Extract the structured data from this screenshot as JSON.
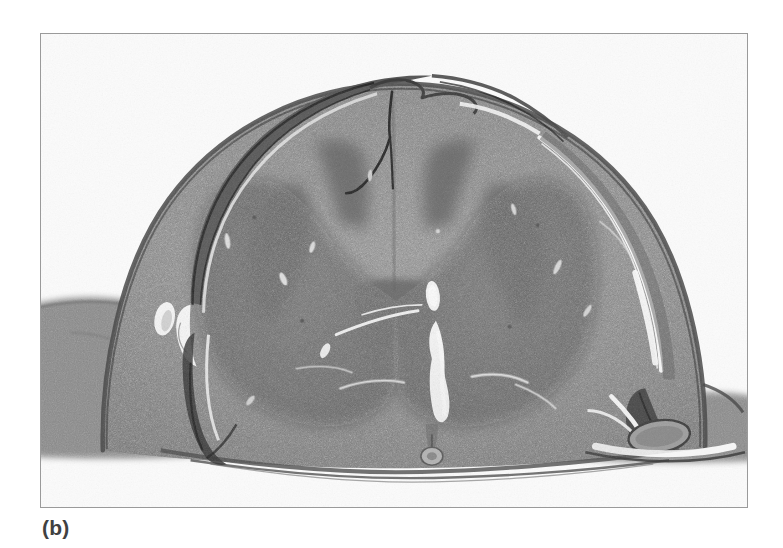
{
  "figure": {
    "caption": "(b)",
    "panel_label": "b",
    "type": "photomicrograph",
    "modality": "light microscopy, transverse histological section",
    "color_mode": "grayscale",
    "page_background": "#ffffff",
    "frame": {
      "border_color": "#9a9a9a",
      "border_width_px": 1,
      "x": 40,
      "y": 33,
      "width": 708,
      "height": 475
    },
    "slide_background": "#fbfbfb"
  },
  "specimen": {
    "name": "Spinal cord transverse section",
    "regions": [
      {
        "name": "white-matter",
        "label": "White matter (funiculi)",
        "tone": "#8d8d8d"
      },
      {
        "name": "gray-matter",
        "label": "Gray matter (butterfly / H-shaped)",
        "tone": "#6f6f6f"
      },
      {
        "name": "posterior-horn",
        "label": "Posterior (dorsal) horn",
        "tone": "#6a6a6a"
      },
      {
        "name": "anterior-horn",
        "label": "Anterior (ventral) horn",
        "tone": "#767676"
      },
      {
        "name": "central-canal",
        "label": "Central canal",
        "tone": "#f6f6f6"
      },
      {
        "name": "anterior-median-fissure",
        "label": "Anterior median fissure",
        "tone": "#f2f2f2"
      },
      {
        "name": "posterior-median-septum",
        "label": "Posterior median septum",
        "tone": "#3a3a3a"
      },
      {
        "name": "pia-mater",
        "label": "Pia mater",
        "tone": "#4a4a4a"
      },
      {
        "name": "dura-mater",
        "label": "Detached dura mater strip",
        "tone": "#5b5b5b"
      },
      {
        "name": "nerve-root",
        "label": "Nerve root / adjacent connective tissue",
        "tone": "#7a7a7a"
      },
      {
        "name": "blood-vessel",
        "label": "Blood vessel",
        "tone": "#c9c9c9"
      },
      {
        "name": "sectioning-artifact",
        "label": "Tear / sectioning artifact",
        "tone": "#fafafa"
      }
    ],
    "palette": {
      "background": "#fbfbfb",
      "white_matter": "#8d8d8d",
      "gray_matter": "#6f6f6f",
      "membrane_dark": "#3f3f3f",
      "artifact_light": "#f7f7f7",
      "frame": "#9a9a9a",
      "caption_text": "#414141"
    }
  }
}
